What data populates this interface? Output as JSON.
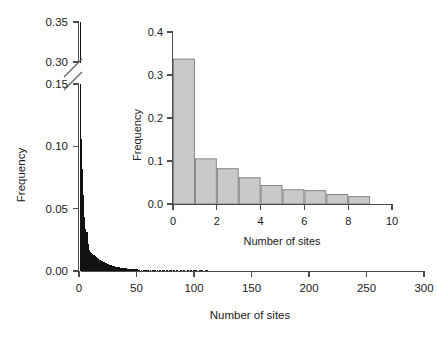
{
  "figure": {
    "background": "#ffffff",
    "bar_color_main": "#111111",
    "bar_color_inset": "#c9c9c9",
    "bar_border_inset": "#7a7a7a",
    "axis_color": "#4d4d4d"
  },
  "main": {
    "xlabel": "Number of sites",
    "ylabel": "Frequency",
    "x_ticks": [
      "0",
      "50",
      "100",
      "150",
      "200",
      "250",
      "300"
    ],
    "y_ticks_lower": [
      "0.00",
      "0.05",
      "0.10",
      "0.15"
    ],
    "y_ticks_upper": [
      "0.30",
      "0.35"
    ],
    "axis_break": true
  },
  "inset": {
    "xlabel": "Number of sites",
    "ylabel": "Frequency",
    "x_ticks": [
      "0",
      "2",
      "4",
      "6",
      "8",
      "10"
    ],
    "y_ticks": [
      "0.0",
      "0.1",
      "0.2",
      "0.3",
      "0.4"
    ]
  },
  "chart_data": [
    {
      "type": "bar",
      "name": "main-histogram",
      "title": "",
      "xlabel": "Number of sites",
      "ylabel": "Frequency",
      "xlim": [
        0,
        300
      ],
      "ylim": [
        0.0,
        0.35
      ],
      "y_axis_break": {
        "lower_max": 0.15,
        "upper_min": 0.3
      },
      "xticks": [
        0,
        50,
        100,
        150,
        200,
        250,
        300
      ],
      "yticks_lower": [
        0.0,
        0.05,
        0.1,
        0.15
      ],
      "yticks_upper": [
        0.3,
        0.35
      ],
      "grid": false,
      "legend": "none",
      "note": "Heavily right-skewed histogram of number of sites; first bin is truncated by the broken axis and reaches ~0.34",
      "x": [
        1,
        2,
        3,
        4,
        5,
        6,
        7,
        8,
        9,
        10,
        11,
        12,
        13,
        14,
        15,
        16,
        17,
        18,
        19,
        20,
        21,
        22,
        23,
        24,
        25,
        26,
        27,
        28,
        29,
        30,
        31,
        32,
        33,
        34,
        35,
        36,
        37,
        38,
        39,
        40,
        41,
        42,
        43,
        44,
        45,
        46,
        47,
        48,
        49,
        50,
        52,
        54,
        56,
        58,
        60,
        62,
        64,
        66,
        68,
        70,
        73,
        76,
        79,
        82,
        85,
        88,
        91,
        94,
        97,
        100,
        105,
        110,
        115,
        120,
        125,
        130,
        135,
        140,
        145,
        150,
        158,
        166,
        174,
        182,
        190,
        198,
        206,
        214,
        222,
        230,
        240,
        250,
        260,
        270,
        280,
        290
      ],
      "values": [
        0.338,
        0.106,
        0.082,
        0.061,
        0.043,
        0.034,
        0.031,
        0.022,
        0.017,
        0.0155,
        0.0145,
        0.0138,
        0.0128,
        0.012,
        0.0113,
        0.0105,
        0.0098,
        0.0092,
        0.0086,
        0.008,
        0.0075,
        0.007,
        0.0066,
        0.0062,
        0.0058,
        0.0054,
        0.005,
        0.0047,
        0.0044,
        0.0041,
        0.0038,
        0.0036,
        0.0034,
        0.0032,
        0.003,
        0.0028,
        0.0026,
        0.0025,
        0.0023,
        0.0022,
        0.0021,
        0.002,
        0.0019,
        0.0018,
        0.0017,
        0.0016,
        0.0015,
        0.0015,
        0.0014,
        0.0013,
        0.0012,
        0.0012,
        0.0011,
        0.0011,
        0.001,
        0.001,
        0.0009,
        0.0009,
        0.0008,
        0.0008,
        0.0008,
        0.0007,
        0.0007,
        0.0007,
        0.0006,
        0.0006,
        0.0006,
        0.0006,
        0.0005,
        0.0005,
        0.0005,
        0.0005,
        0.0004,
        0.0004,
        0.0004,
        0.0004,
        0.0004,
        0.0003,
        0.0003,
        0.0003,
        0.0003,
        0.0003,
        0.0003,
        0.0002,
        0.0002,
        0.0002,
        0.0002,
        0.0002,
        0.0002,
        0.0002,
        0.0002,
        0.0002,
        0.0001,
        0.0001,
        0.0001,
        0.0001
      ]
    },
    {
      "type": "bar",
      "name": "inset-histogram",
      "title": "",
      "xlabel": "Number of sites",
      "ylabel": "Frequency",
      "xlim": [
        0,
        10
      ],
      "ylim": [
        0.0,
        0.4
      ],
      "xticks": [
        0,
        2,
        4,
        6,
        8,
        10
      ],
      "yticks": [
        0.0,
        0.1,
        0.2,
        0.3,
        0.4
      ],
      "grid": false,
      "legend": "none",
      "categories": [
        1,
        2,
        3,
        4,
        5,
        6,
        7,
        8,
        9
      ],
      "values": [
        0.337,
        0.105,
        0.082,
        0.061,
        0.043,
        0.033,
        0.031,
        0.022,
        0.017
      ]
    }
  ]
}
